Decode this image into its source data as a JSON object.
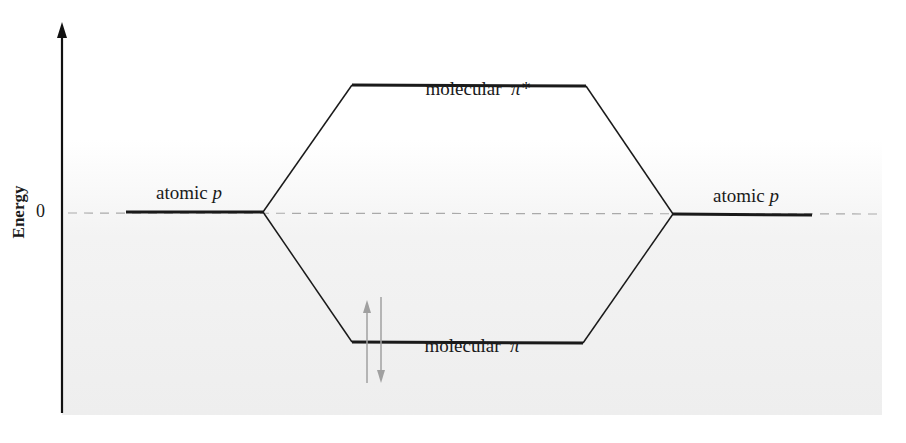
{
  "diagram": {
    "axis": {
      "label": "Energy",
      "zero_tick": "0"
    },
    "levels": {
      "atomic_left": {
        "text": "atomic ",
        "symbol": "p"
      },
      "atomic_right": {
        "text": "atomic ",
        "symbol": "p"
      },
      "antibonding": {
        "text": "molecular  ",
        "symbol": "π*"
      },
      "bonding": {
        "text": "molecular  ",
        "symbol": "π"
      }
    },
    "electrons": {
      "count": 2,
      "spins": [
        "up",
        "down"
      ],
      "level": "bonding"
    },
    "colors": {
      "line": "#1a1a1a",
      "dashed": "#aaaaaa",
      "electron_arrow": "#a0a0a0"
    }
  }
}
